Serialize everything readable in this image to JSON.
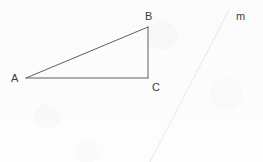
{
  "figure": {
    "kind": "geometry-diagram",
    "width": 263,
    "height": 162,
    "background_color": "#fdfdfd",
    "stroke_color": "#5f5f5f",
    "faint_stroke_color": "#dcdcdc",
    "label_color": "#3b3b3b"
  },
  "triangle": {
    "name": "triangle-abc",
    "stroke_color": "#5f5f5f",
    "stroke_width": 1,
    "fill": "none",
    "points": "26,78 148,27 148,78",
    "vertices": [
      {
        "id": "A",
        "label": "A",
        "x": 26,
        "y": 78,
        "label_x": 11,
        "label_y": 73
      },
      {
        "id": "B",
        "label": "B",
        "x": 148,
        "y": 27,
        "label_x": 145,
        "label_y": 11
      },
      {
        "id": "C",
        "label": "C",
        "x": 148,
        "y": 78,
        "label_x": 152,
        "label_y": 82
      }
    ],
    "edges": [
      {
        "id": "AB",
        "from": "A",
        "to": "B",
        "x1": 26,
        "y1": 78,
        "x2": 148,
        "y2": 27
      },
      {
        "id": "BC",
        "from": "B",
        "to": "C",
        "x1": 148,
        "y1": 27,
        "x2": 148,
        "y2": 78
      },
      {
        "id": "AC",
        "from": "A",
        "to": "C",
        "x1": 26,
        "y1": 78,
        "x2": 148,
        "y2": 78
      }
    ]
  },
  "line_m": {
    "name": "line-m",
    "label": "m",
    "style": "dotted",
    "stroke_color": "#dcdcdc",
    "stroke_width": 1,
    "dash_pattern": "1 2",
    "x1": 150,
    "y1": 162,
    "x2": 229,
    "y2": 10,
    "label_x": 236,
    "label_y": 11
  }
}
